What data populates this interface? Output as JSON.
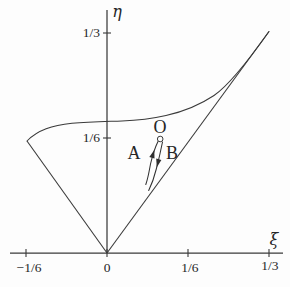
{
  "figure": {
    "background_color": "#fdfdfd",
    "line_color": "#3a3a3a",
    "text_color": "#262626"
  },
  "labels": {
    "eta": "η",
    "xi": "ξ",
    "point_o": "O",
    "trajectory_a": "A",
    "trajectory_b": "B",
    "y_ticks": [
      "1/3",
      "1/6"
    ],
    "x_ticks": [
      "−1/6",
      "0",
      "1/6",
      "1/3"
    ]
  },
  "chart_data": {
    "type": "line",
    "title": "",
    "xlabel": "ξ",
    "ylabel": "η",
    "grid": false,
    "legend": "none",
    "xlim": [
      -0.2,
      0.36
    ],
    "ylim": [
      0,
      0.37
    ],
    "x_tick_labels": [
      "-1/6",
      "0",
      "1/6",
      "1/3"
    ],
    "x_tick_values": [
      -0.1667,
      0,
      0.1667,
      0.3333
    ],
    "y_tick_labels": [
      "1/6",
      "1/3"
    ],
    "y_tick_values": [
      0.1667,
      0.3333
    ],
    "series": [
      {
        "name": "left-boundary (η = −ξ)",
        "x": [
          0,
          -0.1667
        ],
        "y": [
          0,
          0.1667
        ]
      },
      {
        "name": "right-boundary (η = ξ)",
        "x": [
          0,
          0.3333
        ],
        "y": [
          0,
          0.3333
        ]
      },
      {
        "name": "upper-boundary-curve",
        "x": [
          -0.1667,
          -0.14,
          -0.1,
          -0.05,
          0,
          0.05,
          0.1,
          0.15,
          0.2,
          0.25,
          0.3,
          0.3333
        ],
        "y": [
          0.167,
          0.186,
          0.195,
          0.198,
          0.199,
          0.201,
          0.208,
          0.221,
          0.242,
          0.272,
          0.305,
          0.3333
        ]
      },
      {
        "name": "trajectory-A (flow upward into O, arrow points up)",
        "x": [
          0.08,
          0.088,
          0.097,
          0.105
        ],
        "y": [
          0.104,
          0.127,
          0.148,
          0.169
        ]
      },
      {
        "name": "trajectory-B (flow downward out of O, arrow points down)",
        "x": [
          0.115,
          0.107,
          0.098,
          0.086
        ],
        "y": [
          0.168,
          0.142,
          0.118,
          0.095
        ]
      }
    ],
    "point_O": {
      "x": 0.109,
      "y": 0.173,
      "marker": "open-circle"
    },
    "annotations": [
      {
        "text": "O",
        "x": 0.109,
        "y": 0.187
      },
      {
        "text": "A",
        "x": 0.056,
        "y": 0.146
      },
      {
        "text": "B",
        "x": 0.134,
        "y": 0.146
      }
    ]
  },
  "render": {
    "x_axis": {
      "x1": 10,
      "y1": 253,
      "x2": 283,
      "y2": 253
    },
    "y_axis": {
      "x1": 107,
      "y1": 10,
      "x2": 107,
      "y2": 253
    },
    "x_tick_0": {
      "x1": 26,
      "y1": 249,
      "x2": 26,
      "y2": 257
    },
    "x_tick_1": {
      "x1": 107,
      "y1": 249,
      "x2": 107,
      "y2": 257
    },
    "x_tick_2": {
      "x1": 188,
      "y1": 249,
      "x2": 188,
      "y2": 257
    },
    "x_tick_3": {
      "x1": 269,
      "y1": 249,
      "x2": 269,
      "y2": 257
    },
    "y_tick_0": {
      "x1": 103,
      "y1": 33,
      "x2": 111,
      "y2": 33
    },
    "y_tick_1": {
      "x1": 103,
      "y1": 138,
      "x2": 111,
      "y2": 138
    },
    "left_boundary": {
      "x1": 27,
      "y1": 141,
      "x2": 107,
      "y2": 253
    },
    "right_boundary": {
      "x1": 107,
      "y1": 253,
      "x2": 269,
      "y2": 31.5
    },
    "paths": {
      "upper_curve": "M 27 141 C 38 130 52 125.5 72 123.3 C 88 121.8 104 121.6 122 121 C 138 120.5 152 118.8 166 115.6 C 182 111.9 199 105.5 214 95.5 C 228 86 247 62.5 269 31.5",
      "trajectory_a": "M 158 141.5 C 155 147.5 152.5 155.5 150.5 164 C 149.2 171 148 178.5 145.8 184.5",
      "trajectory_b": "M 162.5 142 C 160.8 150.5 158.8 159.5 156.3 169 C 154.2 177.5 151.5 184.8 148.7 190.5",
      "arrow_a": "M 154.3 149.9 L 154.5 158.5 L 149.3 156.9 Z",
      "arrow_b": "M 156.8 167.2 L 161.4 159.9 L 156.2 158.6 Z"
    },
    "point_o": {
      "cx": 160.2,
      "cy": 139,
      "r": 2.8
    },
    "text": {
      "eta": {
        "x": 117,
        "y": 17
      },
      "xi": {
        "x": 274,
        "y": 245
      },
      "y_tick_0": {
        "x": 100,
        "y": 37
      },
      "y_tick_1": {
        "x": 100,
        "y": 142
      },
      "x_tick_0": {
        "x": 29,
        "y": 272
      },
      "x_tick_1": {
        "x": 107,
        "y": 272
      },
      "x_tick_2": {
        "x": 190,
        "y": 272
      },
      "x_tick_3": {
        "x": 270,
        "y": 270
      },
      "o": {
        "x": 160,
        "y": 133
      },
      "a": {
        "x": 134,
        "y": 159
      },
      "b": {
        "x": 172,
        "y": 159
      }
    }
  }
}
